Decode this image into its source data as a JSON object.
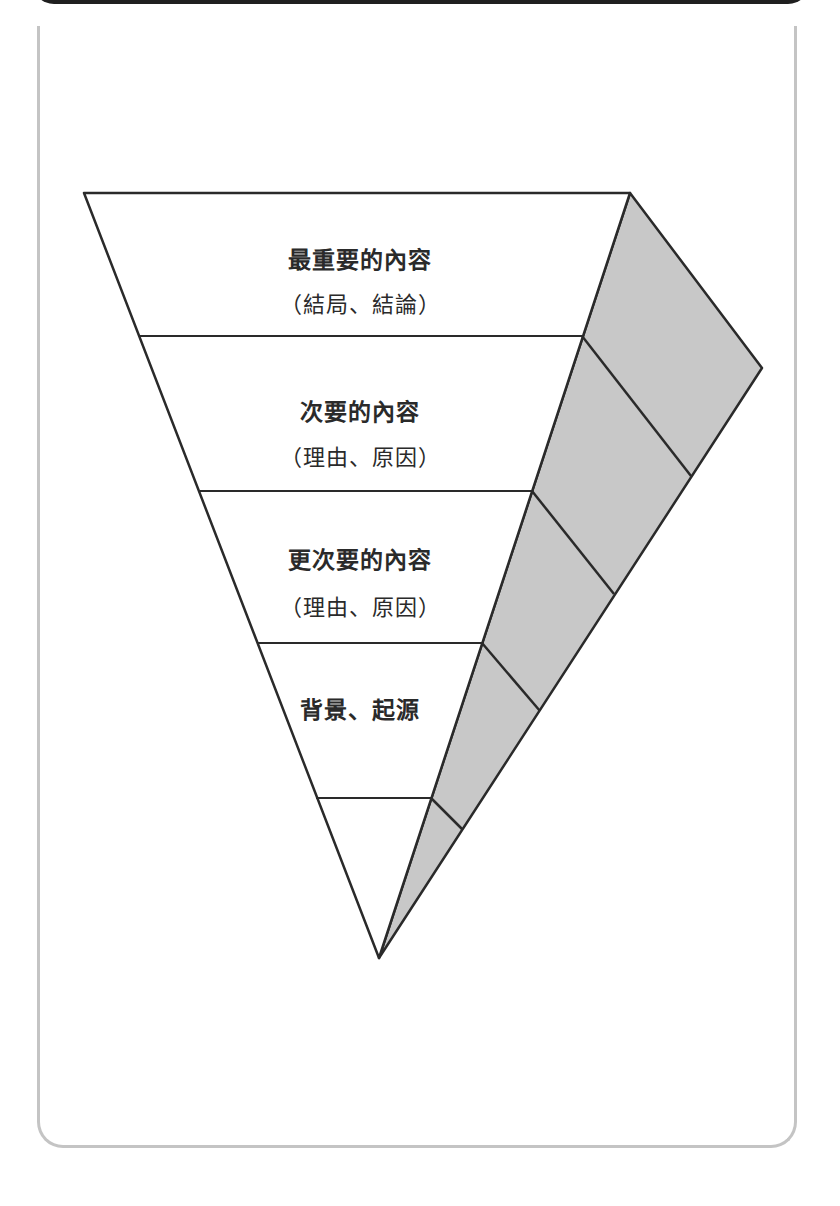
{
  "diagram": {
    "type": "inverted-pyramid",
    "fill_color": "#c8c8c8",
    "stroke_color": "#2a2a2a",
    "layers": [
      {
        "title": "最重要的內容",
        "subtitle": "（結局、結論）"
      },
      {
        "title": "次要的內容",
        "subtitle": "（理由、原因）"
      },
      {
        "title": "更次要的內容",
        "subtitle": "（理由、原因）"
      },
      {
        "title": "背景、起源",
        "subtitle": ""
      },
      {
        "title": "",
        "subtitle": ""
      }
    ]
  }
}
